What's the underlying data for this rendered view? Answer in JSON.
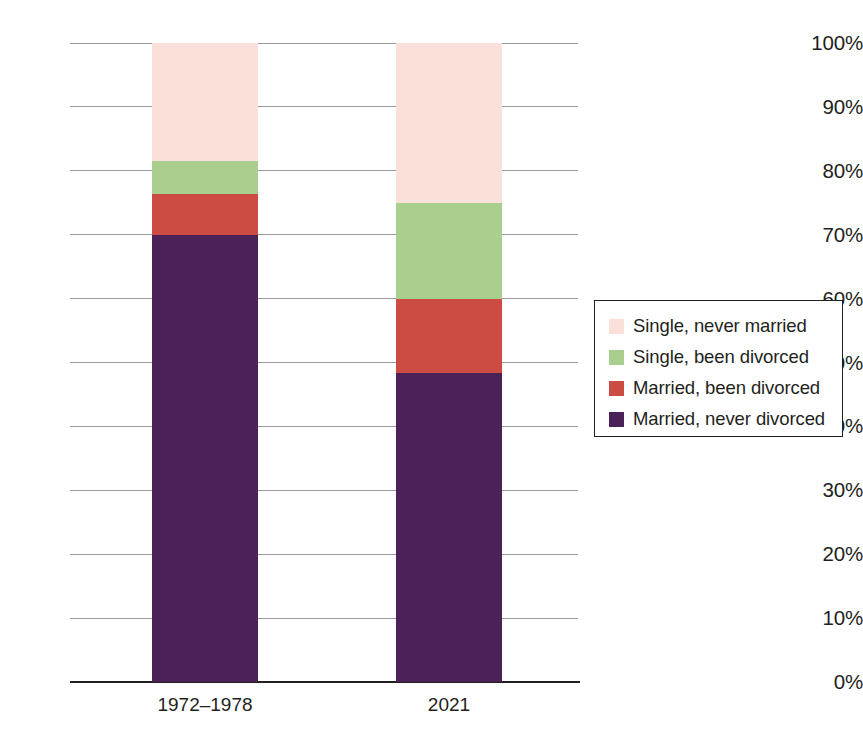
{
  "chart_data": {
    "type": "bar",
    "subtype": "stacked-bar-100-percent",
    "title": "",
    "subtitle": "",
    "xlabel": "",
    "ylabel": "",
    "categories": [
      "1972–1978",
      "2021"
    ],
    "ylim": [
      0,
      100
    ],
    "ytick_labels": [
      "0%",
      "10%",
      "20%",
      "30%",
      "40%",
      "50%",
      "60%",
      "70%",
      "80%",
      "90%",
      "100%"
    ],
    "ytick_values": [
      0,
      10,
      20,
      30,
      40,
      50,
      60,
      70,
      80,
      90,
      100
    ],
    "grid": true,
    "grid_axis": "y",
    "legend_position": "right",
    "stack_order_bottom_to_top": [
      "Married, never divorced",
      "Married, been divorced",
      "Single, been divorced",
      "Single, never married"
    ],
    "series": [
      {
        "name": "Married, never divorced",
        "color": "#4a2257",
        "values": [
          70.0,
          48.3
        ]
      },
      {
        "name": "Married, been divorced",
        "color": "#cc4b42",
        "values": [
          6.3,
          11.7
        ]
      },
      {
        "name": "Single, been divorced",
        "color": "#a9cf8e",
        "values": [
          5.2,
          15.0
        ]
      },
      {
        "name": "Single, never married",
        "color": "#fae0d8",
        "values": [
          18.5,
          25.0
        ]
      }
    ]
  },
  "legend": {
    "items": [
      {
        "label": "Single, never married",
        "color": "#fae0d8"
      },
      {
        "label": "Single, been divorced",
        "color": "#a9cf8e"
      },
      {
        "label": "Married, been divorced",
        "color": "#cc4b42"
      },
      {
        "label": "Married, never divorced",
        "color": "#4a2257"
      }
    ]
  },
  "axes": {
    "y_ticks": [
      {
        "label": "100%",
        "value": 100
      },
      {
        "label": "90%",
        "value": 90
      },
      {
        "label": "80%",
        "value": 80
      },
      {
        "label": "70%",
        "value": 70
      },
      {
        "label": "60%",
        "value": 60
      },
      {
        "label": "50%",
        "value": 50
      },
      {
        "label": "40%",
        "value": 40
      },
      {
        "label": "30%",
        "value": 30
      },
      {
        "label": "20%",
        "value": 20
      },
      {
        "label": "10%",
        "value": 10
      },
      {
        "label": "0%",
        "value": 0
      }
    ],
    "x_ticks": [
      {
        "label": "1972–1978",
        "center": 205
      },
      {
        "label": "2021",
        "center": 449
      }
    ]
  },
  "geometry": {
    "y_top_px": 43,
    "y_bottom_px": 682,
    "grid_left_px": 70,
    "grid_width_px": 508,
    "bar_width_px": 106,
    "bar_left_px": [
      152,
      396
    ],
    "xlabel_y_px": 694
  },
  "colors": {
    "single_never_married": "#fae0d8",
    "single_been_divorced": "#a9cf8e",
    "married_been_divorced": "#cc4b42",
    "married_never_divorced": "#4a2257",
    "gridline": "#9a9a9a",
    "axis": "#231f20",
    "text": "#231f20",
    "background": "#ffffff"
  }
}
